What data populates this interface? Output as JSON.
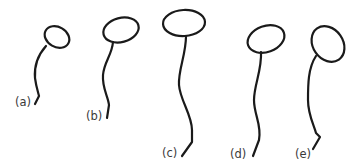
{
  "diagram": {
    "colors": {
      "stroke": "#1a1a1a",
      "label": "#3a3a3a",
      "background": "#ffffff"
    },
    "figures": [
      {
        "id": "a",
        "label": "(a)"
      },
      {
        "id": "b",
        "label": "(b)"
      },
      {
        "id": "c",
        "label": "(c)"
      },
      {
        "id": "d",
        "label": "(d)"
      },
      {
        "id": "e",
        "label": "(e)"
      }
    ]
  }
}
